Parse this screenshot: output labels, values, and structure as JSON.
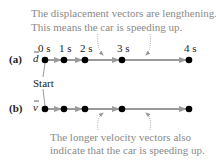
{
  "top_caption": {
    "line1": "The displacement vectors are lengthening.",
    "line2": "This means the car is speeding up."
  },
  "bottom_caption": {
    "line1": "The longer velocity vectors also",
    "line2": "indicate that the car is speeding up."
  },
  "row_a": {
    "label": "(a)",
    "symbol": "d",
    "times": [
      "0 s",
      "1 s",
      "2 s",
      "3 s",
      "4 s"
    ],
    "dot_x": [
      45,
      64,
      85,
      122,
      189
    ],
    "y": 60
  },
  "row_b": {
    "label": "(b)",
    "symbol": "v",
    "dot_x": [
      45,
      64,
      85,
      122,
      189
    ],
    "y": 109
  },
  "start_label": "Start",
  "colors": {
    "arrow": "#9a9a9a",
    "dot": "#000000",
    "caption": "#8a8a8a"
  }
}
